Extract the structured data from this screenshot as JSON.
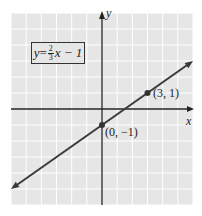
{
  "chart_data": {
    "type": "line",
    "title": "",
    "xlabel": "x",
    "ylabel": "y",
    "xlim": [
      -6,
      6
    ],
    "ylim": [
      -6,
      6
    ],
    "grid": true,
    "equation": {
      "lhs": "y",
      "eq": " = ",
      "num": "2",
      "den": "3",
      "rest": "x − 1"
    },
    "line": {
      "slope": 0.6667,
      "intercept": -1
    },
    "points": [
      {
        "x": 0,
        "y": -1,
        "label": "(0, −1)"
      },
      {
        "x": 3,
        "y": 1,
        "label": "(3, 1)"
      }
    ]
  },
  "colors": {
    "grid_bg": "#e6e6e6",
    "grid_line": "#ffffff",
    "axis": "#222222",
    "line": "#3a3a3a"
  }
}
